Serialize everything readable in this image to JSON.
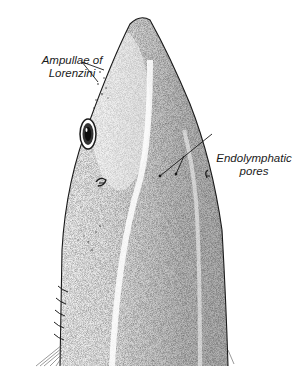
{
  "figure": {
    "background_color": "#ffffff",
    "ink_color": "#1a1a1a"
  },
  "labels": {
    "ampullae": {
      "line1": "Ampullae of",
      "line2": "Lorenzini"
    },
    "endolymphatic": {
      "line1": "Endolymphatic",
      "line2": "pores"
    }
  },
  "parts": [
    "snout",
    "eye",
    "spiracle",
    "gill-slits",
    "endolymphatic-pores",
    "ampullae-of-lorenzini",
    "pectoral-fin-edge"
  ]
}
